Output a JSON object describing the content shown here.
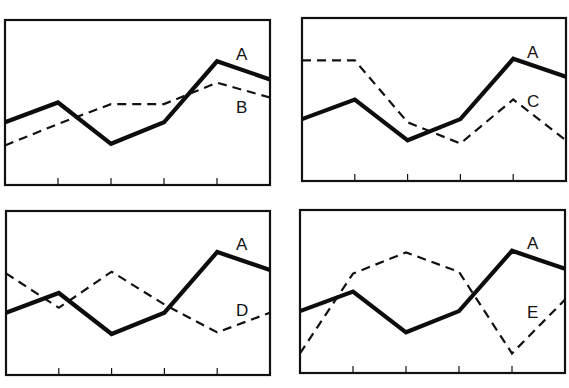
{
  "chart_data": [
    {
      "type": "line",
      "panel": "top-left",
      "title": "",
      "xlabel": "",
      "ylabel": "",
      "ylim": [
        0,
        10
      ],
      "x": [
        0,
        1,
        2,
        3,
        4,
        5
      ],
      "x_ticks_visible": [
        1,
        2,
        3,
        4
      ],
      "grid": false,
      "legend": "inline labels at right",
      "series": [
        {
          "name": "A",
          "style": "solid-thick",
          "values": [
            3.8,
            5.0,
            2.5,
            3.8,
            7.5,
            6.4
          ]
        },
        {
          "name": "B",
          "style": "dashed",
          "values": [
            2.4,
            3.7,
            4.9,
            4.9,
            6.2,
            5.3
          ]
        }
      ]
    },
    {
      "type": "line",
      "panel": "top-right",
      "title": "",
      "xlabel": "",
      "ylabel": "",
      "ylim": [
        0,
        10
      ],
      "x": [
        0,
        1,
        2,
        3,
        4,
        5
      ],
      "x_ticks_visible": [
        1,
        2,
        3,
        4
      ],
      "grid": false,
      "legend": "inline labels at right",
      "series": [
        {
          "name": "A",
          "style": "solid-thick",
          "values": [
            3.8,
            5.0,
            2.5,
            3.8,
            7.5,
            6.4
          ]
        },
        {
          "name": "C",
          "style": "dashed",
          "values": [
            7.4,
            7.4,
            3.6,
            2.3,
            5.0,
            2.5
          ]
        }
      ]
    },
    {
      "type": "line",
      "panel": "bottom-left",
      "title": "",
      "xlabel": "",
      "ylabel": "",
      "ylim": [
        0,
        10
      ],
      "x": [
        0,
        1,
        2,
        3,
        4,
        5
      ],
      "x_ticks_visible": [
        1,
        2,
        3,
        4
      ],
      "grid": false,
      "legend": "inline labels at right",
      "series": [
        {
          "name": "A",
          "style": "solid-thick",
          "values": [
            3.8,
            5.0,
            2.5,
            3.8,
            7.5,
            6.4
          ]
        },
        {
          "name": "D",
          "style": "dashed",
          "values": [
            6.2,
            4.1,
            6.3,
            4.3,
            2.6,
            3.8
          ]
        }
      ]
    },
    {
      "type": "line",
      "panel": "bottom-right",
      "title": "",
      "xlabel": "",
      "ylabel": "",
      "ylim": [
        0,
        10
      ],
      "x": [
        0,
        1,
        2,
        3,
        4,
        5
      ],
      "x_ticks_visible": [
        1,
        2,
        3,
        4
      ],
      "grid": false,
      "legend": "inline labels at right",
      "series": [
        {
          "name": "A",
          "style": "solid-thick",
          "values": [
            3.8,
            5.0,
            2.5,
            3.8,
            7.5,
            6.4
          ]
        },
        {
          "name": "E",
          "style": "dashed",
          "values": [
            1.2,
            6.1,
            7.4,
            6.2,
            1.2,
            4.5
          ]
        }
      ]
    }
  ],
  "panels": [
    {
      "id": "top-left",
      "box": {
        "left": 5,
        "top": 20,
        "right": 270,
        "bottom": 185
      },
      "labels": [
        {
          "text": "A",
          "x": 236,
          "y": 60
        },
        {
          "text": "B",
          "x": 236,
          "y": 113
        }
      ]
    },
    {
      "id": "top-right",
      "box": {
        "left": 302,
        "top": 18,
        "right": 566,
        "bottom": 181
      },
      "labels": [
        {
          "text": "A",
          "x": 527,
          "y": 58
        },
        {
          "text": "C",
          "x": 527,
          "y": 107
        }
      ]
    },
    {
      "id": "bottom-left",
      "box": {
        "left": 6,
        "top": 211,
        "right": 270,
        "bottom": 375
      },
      "labels": [
        {
          "text": "A",
          "x": 236,
          "y": 250
        },
        {
          "text": "D",
          "x": 236,
          "y": 316
        }
      ]
    },
    {
      "id": "bottom-right",
      "box": {
        "left": 300,
        "top": 210,
        "right": 565,
        "bottom": 373
      },
      "labels": [
        {
          "text": "A",
          "x": 527,
          "y": 249
        },
        {
          "text": "E",
          "x": 527,
          "y": 318
        }
      ]
    }
  ]
}
